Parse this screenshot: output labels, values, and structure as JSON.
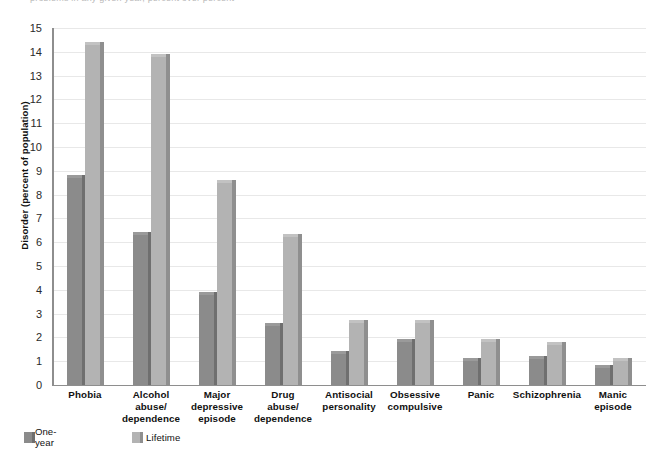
{
  "caption": {
    "text": "problems in any given year, percent over percent"
  },
  "legend": {
    "position": "bottom-left",
    "items": [
      {
        "key": "one-year",
        "label": "One-year",
        "color": "#8b8b8b"
      },
      {
        "key": "lifetime",
        "label": "Lifetime",
        "color": "#b3b3b3"
      }
    ]
  },
  "chart_data": {
    "type": "bar",
    "title": "",
    "xlabel": "",
    "ylabel": "Disorder (percent of population)",
    "ylim": [
      0,
      15
    ],
    "ytick_labels": [
      "15",
      "14",
      "13",
      "12",
      "11",
      "10",
      "9",
      "8",
      "7",
      "6",
      "5",
      "4",
      "3",
      "2",
      "1",
      "0"
    ],
    "yticks": [
      15,
      14,
      13,
      12,
      11,
      10,
      9,
      8,
      7,
      6,
      5,
      4,
      3,
      2,
      1,
      0
    ],
    "grid": true,
    "legend_position": "bottom-left",
    "categories": [
      "Phobia",
      "Alcohol\nabuse/\ndependence",
      "Major\ndepressive\nepisode",
      "Drug\nabuse/\ndependence",
      "Antisocial\npersonality",
      "Obsessive\ncompulsive",
      "Panic",
      "Schizophrenia",
      "Manic\nepisode"
    ],
    "series": [
      {
        "name": "One-year",
        "color": "#8b8b8b",
        "values": [
          8.7,
          6.3,
          3.8,
          2.5,
          1.3,
          1.8,
          1.0,
          1.1,
          0.7
        ]
      },
      {
        "name": "Lifetime",
        "color": "#b3b3b3",
        "values": [
          14.3,
          13.8,
          8.5,
          6.2,
          2.6,
          2.6,
          1.8,
          1.7,
          1.0
        ]
      }
    ]
  }
}
